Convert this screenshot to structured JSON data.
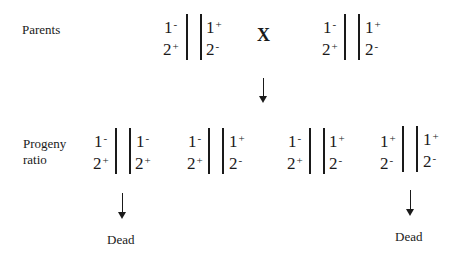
{
  "labels": {
    "parents": "Parents",
    "progeny_line1": "Progeny",
    "progeny_line2": "ratio",
    "cross": "X",
    "dead_left": "Dead",
    "dead_right": "Dead"
  },
  "parents": [
    {
      "left_top": "1",
      "left_top_sign": "-",
      "left_bottom": "2",
      "left_bottom_sign": "+",
      "right_top": "1",
      "right_top_sign": "+",
      "right_bottom": "2",
      "right_bottom_sign": "-"
    },
    {
      "left_top": "1",
      "left_top_sign": "-",
      "left_bottom": "2",
      "left_bottom_sign": "+",
      "right_top": "1",
      "right_top_sign": "+",
      "right_bottom": "2",
      "right_bottom_sign": "-"
    }
  ],
  "progeny": [
    {
      "left_top": "1",
      "left_top_sign": "-",
      "left_bottom": "2",
      "left_bottom_sign": "+",
      "right_top": "1",
      "right_top_sign": "-",
      "right_bottom": "2",
      "right_bottom_sign": "+",
      "fate": "Dead"
    },
    {
      "left_top": "1",
      "left_top_sign": "-",
      "left_bottom": "2",
      "left_bottom_sign": "+",
      "right_top": "1",
      "right_top_sign": "+",
      "right_bottom": "2",
      "right_bottom_sign": "-"
    },
    {
      "left_top": "1",
      "left_top_sign": "-",
      "left_bottom": "2",
      "left_bottom_sign": "+",
      "right_top": "1",
      "right_top_sign": "+",
      "right_bottom": "2",
      "right_bottom_sign": "-"
    },
    {
      "left_top": "1",
      "left_top_sign": "+",
      "left_bottom": "2",
      "left_bottom_sign": "-",
      "right_top": "1",
      "right_top_sign": "+",
      "right_bottom": "2",
      "right_bottom_sign": "-",
      "fate": "Dead"
    }
  ]
}
